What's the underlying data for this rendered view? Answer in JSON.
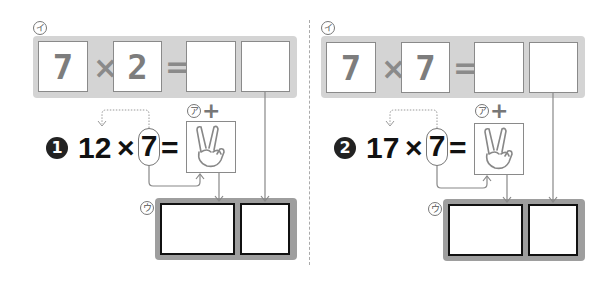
{
  "divider": "dashed-vertical",
  "problems": [
    {
      "number_label": "1",
      "label_i": "イ",
      "label_a": "ア",
      "label_u": "ウ",
      "plus_sign": "+",
      "top_row": {
        "a": "7",
        "times": "×",
        "b": "2",
        "equals": "=",
        "answer_tens": "",
        "answer_ones": ""
      },
      "expression": {
        "left": "12",
        "times": "×",
        "circled": "7",
        "equals": "="
      },
      "hand_icon": "peace-hand-icon",
      "answer_boxes": [
        "",
        ""
      ]
    },
    {
      "number_label": "2",
      "label_i": "イ",
      "label_a": "ア",
      "label_u": "ウ",
      "plus_sign": "+",
      "top_row": {
        "a": "7",
        "times": "×",
        "b": "7",
        "equals": "=",
        "answer_tens": "",
        "answer_ones": ""
      },
      "expression": {
        "left": "17",
        "times": "×",
        "circled": "7",
        "equals": "="
      },
      "hand_icon": "peace-hand-icon",
      "answer_boxes": [
        "",
        ""
      ]
    }
  ],
  "colors": {
    "band": "#d4d4d4",
    "answer_band": "#9e9e9e",
    "text_gray": "#7d7d7d",
    "text_dark": "#111111"
  }
}
